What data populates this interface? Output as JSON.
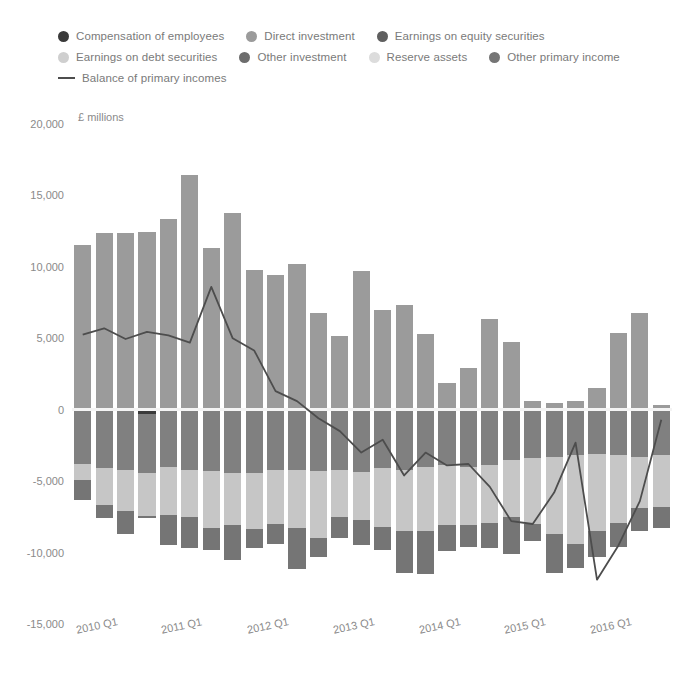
{
  "chart_data": {
    "type": "bar",
    "title": "",
    "xlabel": "",
    "ylabel": "£ millions",
    "ylim": [
      -15000,
      20000
    ],
    "ytick_step": 5000,
    "yticks": [
      "20,000",
      "15,000",
      "10,000",
      "5,000",
      "0",
      "-5,000",
      "-10,000",
      "-15,000"
    ],
    "ytick_values": [
      20000,
      15000,
      10000,
      5000,
      0,
      -5000,
      -10000,
      -15000
    ],
    "grid": false,
    "zero_line": true,
    "legend_position": "top",
    "categories": [
      "2010 Q1",
      "2010 Q2",
      "2010 Q3",
      "2010 Q4",
      "2011 Q1",
      "2011 Q2",
      "2011 Q3",
      "2011 Q4",
      "2012 Q1",
      "2012 Q2",
      "2012 Q3",
      "2012 Q4",
      "2013 Q1",
      "2013 Q2",
      "2013 Q3",
      "2013 Q4",
      "2014 Q1",
      "2014 Q2",
      "2014 Q3",
      "2014 Q4",
      "2015 Q1",
      "2015 Q2",
      "2015 Q3",
      "2015 Q4",
      "2016 Q1",
      "2016 Q2",
      "2016 Q3",
      "2016 Q4"
    ],
    "xtick_labels": [
      "2010 Q1",
      "2011 Q1",
      "2012 Q1",
      "2013 Q1",
      "2014 Q1",
      "2015 Q1",
      "2016 Q1"
    ],
    "xtick_indices": [
      0,
      4,
      8,
      12,
      16,
      20,
      24
    ],
    "series": [
      {
        "name": "Compensation of employees",
        "color": "#3a3a3a",
        "values": [
          0,
          0,
          0,
          -300,
          0,
          0,
          0,
          0,
          0,
          0,
          0,
          0,
          0,
          0,
          0,
          0,
          0,
          0,
          0,
          0,
          0,
          0,
          0,
          0,
          0,
          0,
          0,
          0
        ]
      },
      {
        "name": "Direct investment",
        "color": "#9b9b9b",
        "values": [
          11500,
          12400,
          12350,
          12450,
          13350,
          16450,
          11350,
          13750,
          9800,
          9400,
          10200,
          6800,
          5150,
          9700,
          6950,
          7350,
          5300,
          1900,
          2900,
          6350,
          4750,
          600,
          500,
          600,
          1500,
          5350,
          6800,
          300
        ]
      },
      {
        "name": "Earnings on equity securities",
        "color": "#5f5f5f",
        "values": [
          0,
          0,
          0,
          0,
          0,
          0,
          0,
          0,
          0,
          0,
          0,
          0,
          0,
          0,
          0,
          0,
          0,
          0,
          0,
          0,
          0,
          0,
          0,
          0,
          0,
          0,
          0,
          0
        ]
      },
      {
        "name": "Earnings on debt securities",
        "color": "#808080",
        "values": [
          -3800,
          -4100,
          -4200,
          -4150,
          -4000,
          -4200,
          -4300,
          -4400,
          -4450,
          -4200,
          -4250,
          -4300,
          -4200,
          -4350,
          -4100,
          -4200,
          -4000,
          -3900,
          -4000,
          -3900,
          -3500,
          -3400,
          -3300,
          -3200,
          -3100,
          -3200,
          -3300,
          -3200
        ]
      },
      {
        "name": "Other investment",
        "color": "#6d6d6d",
        "values": [
          0,
          0,
          0,
          0,
          0,
          0,
          0,
          0,
          0,
          0,
          0,
          0,
          0,
          0,
          0,
          0,
          0,
          0,
          0,
          0,
          0,
          0,
          0,
          0,
          0,
          0,
          0,
          0
        ]
      },
      {
        "name": "Reserve assets",
        "color": "#c6c6c6",
        "values": [
          -1100,
          -2600,
          -2900,
          -3000,
          -3400,
          -3300,
          -4000,
          -3700,
          -3900,
          -3800,
          -4000,
          -4700,
          -3300,
          -3400,
          -4100,
          -4300,
          -4500,
          -4200,
          -4100,
          -4000,
          -4000,
          -4600,
          -5400,
          -6200,
          -5400,
          -4700,
          -3600,
          -3600
        ]
      },
      {
        "name": "Other primary income",
        "color": "#757575",
        "values": [
          -1400,
          -900,
          -1600,
          -100,
          -2100,
          -2200,
          -1500,
          -2400,
          -1300,
          -1400,
          -2900,
          -1300,
          -1500,
          -1700,
          -1600,
          -2900,
          -3000,
          -1800,
          -1500,
          -1800,
          -2600,
          -1200,
          -2700,
          -1700,
          -1800,
          -1700,
          -1600,
          -1500
        ]
      }
    ],
    "line_series": {
      "name": "Balance of primary incomes",
      "color": "#4d4d4d",
      "values": [
        5250,
        5700,
        4950,
        5450,
        5200,
        4700,
        8600,
        5000,
        4150,
        1300,
        600,
        -600,
        -1500,
        -3000,
        -2100,
        -4600,
        -3000,
        -3900,
        -3800,
        -5400,
        -7800,
        -8000,
        -5800,
        -2300,
        -11900,
        -9500,
        -6400,
        -700
      ]
    }
  },
  "legend": {
    "rows": [
      [
        {
          "label": "Compensation of employees",
          "color": "#3a3a3a",
          "marker": "dot"
        },
        {
          "label": "Direct investment",
          "color": "#9b9b9b",
          "marker": "dot"
        },
        {
          "label": "Earnings on equity securities",
          "color": "#5f5f5f",
          "marker": "dot"
        }
      ],
      [
        {
          "label": "Earnings on debt securities",
          "color": "#cfcfcf",
          "marker": "dot"
        },
        {
          "label": "Other investment",
          "color": "#6d6d6d",
          "marker": "dot"
        },
        {
          "label": "Reserve assets",
          "color": "#dcdcdc",
          "marker": "dot"
        },
        {
          "label": "Other primary income",
          "color": "#757575",
          "marker": "dot"
        }
      ],
      [
        {
          "label": "Balance of primary incomes",
          "color": "#4d4d4d",
          "marker": "line"
        }
      ]
    ]
  }
}
